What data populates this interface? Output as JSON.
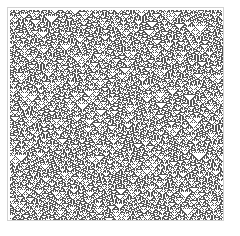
{
  "figure": {
    "kind": "cellular-automaton-raster",
    "title": "",
    "background_color": "#ffffff",
    "canvas_width": 240,
    "canvas_height": 236
  },
  "frame": {
    "x": 7,
    "y": 7,
    "width": 217,
    "height": 214,
    "border_color": "#d2d2d2",
    "border_width": 1,
    "fill_color": "#ffffff"
  },
  "chart_data": {
    "type": "heatmap",
    "title": "",
    "subtitle": "",
    "xlabel": "",
    "ylabel": "",
    "legend": [],
    "annotations": [],
    "grid": false,
    "rule_number": 90,
    "rule_name": "Rule 90",
    "rule_binary": "01011010",
    "neighborhood": 3,
    "states": 2,
    "initial_condition": "random",
    "initial_density": 0.5,
    "boundary": "periodic",
    "random_seed": 20250419,
    "columns": 213,
    "rows": 210,
    "cell_size_px": 1,
    "state_colors": [
      "#ffffff",
      "#555555"
    ],
    "state_labels": [
      "dead",
      "alive"
    ],
    "x": [
      0,
      213
    ],
    "y": [
      0,
      210
    ],
    "xlim": [
      0,
      213
    ],
    "ylim": [
      0,
      210
    ]
  }
}
